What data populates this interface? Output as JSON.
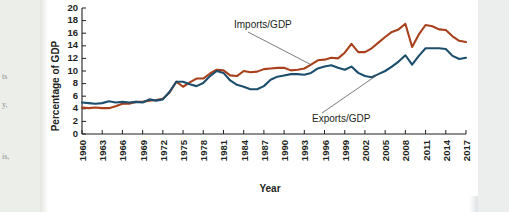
{
  "page": {
    "background_color": "#ffffff",
    "margin_column_color": "#eceeea",
    "right_band_color": "#eceeee",
    "margin_text_fragments": [
      "ts",
      "y,",
      "is,"
    ]
  },
  "chart_data": {
    "type": "line",
    "title": "",
    "xlabel": "Year",
    "ylabel": "Percentage of GDP",
    "ylim": [
      0,
      20
    ],
    "ytick_step": 2,
    "yticks": [
      0,
      2,
      4,
      6,
      8,
      10,
      12,
      14,
      16,
      18,
      20
    ],
    "xlim": [
      1960,
      2017
    ],
    "xticks": [
      1960,
      1963,
      1966,
      1969,
      1972,
      1975,
      1978,
      1981,
      1984,
      1987,
      1990,
      1993,
      1996,
      1999,
      2002,
      2005,
      2008,
      2011,
      2014,
      2017
    ],
    "xtick_labels": [
      "1960",
      "1963",
      "1966",
      "1969",
      "1972",
      "1975",
      "1978",
      "1981",
      "1984",
      "1987",
      "1990",
      "1993",
      "1996",
      "1999",
      "2002",
      "2005",
      "2008",
      "2011",
      "2014",
      "2017"
    ],
    "grid": false,
    "legend_position": "annotation",
    "x": [
      1960,
      1961,
      1962,
      1963,
      1964,
      1965,
      1966,
      1967,
      1968,
      1969,
      1970,
      1971,
      1972,
      1973,
      1974,
      1975,
      1976,
      1977,
      1978,
      1979,
      1980,
      1981,
      1982,
      1983,
      1984,
      1985,
      1986,
      1987,
      1988,
      1989,
      1990,
      1991,
      1992,
      1993,
      1994,
      1995,
      1996,
      1997,
      1998,
      1999,
      2000,
      2001,
      2002,
      2003,
      2004,
      2005,
      2006,
      2007,
      2008,
      2009,
      2010,
      2011,
      2012,
      2013,
      2014,
      2015,
      2016,
      2017
    ],
    "series": [
      {
        "name": "Imports/GDP",
        "color": "#A8401C",
        "values": [
          4.2,
          4.1,
          4.2,
          4.1,
          4.1,
          4.4,
          4.8,
          4.8,
          5.1,
          5.1,
          5.3,
          5.4,
          5.6,
          6.6,
          8.3,
          7.5,
          8.2,
          8.8,
          8.8,
          9.6,
          10.2,
          10.1,
          9.3,
          9.2,
          10.0,
          9.8,
          9.9,
          10.3,
          10.4,
          10.5,
          10.5,
          10.1,
          10.2,
          10.4,
          11.0,
          11.7,
          11.8,
          12.1,
          12.0,
          12.9,
          14.3,
          13.0,
          13.0,
          13.6,
          14.5,
          15.4,
          16.2,
          16.6,
          17.5,
          13.8,
          15.8,
          17.3,
          17.1,
          16.6,
          16.5,
          15.5,
          14.8,
          14.6
        ]
      },
      {
        "name": "Exports/GDP",
        "color": "#1C4E6E",
        "values": [
          5.0,
          4.9,
          4.8,
          4.9,
          5.2,
          5.0,
          5.1,
          5.0,
          5.1,
          5.0,
          5.5,
          5.3,
          5.5,
          6.7,
          8.3,
          8.3,
          7.9,
          7.6,
          8.1,
          9.2,
          10.0,
          9.7,
          8.5,
          7.8,
          7.5,
          7.1,
          7.1,
          7.6,
          8.6,
          9.1,
          9.3,
          9.5,
          9.5,
          9.4,
          9.7,
          10.4,
          10.7,
          10.9,
          10.5,
          10.2,
          10.7,
          9.7,
          9.2,
          9.0,
          9.5,
          10.0,
          10.7,
          11.5,
          12.5,
          11.0,
          12.4,
          13.6,
          13.6,
          13.6,
          13.5,
          12.4,
          11.9,
          12.1
        ]
      }
    ],
    "annotations": [
      {
        "text": "Imports/GDP",
        "series": "Imports/GDP"
      },
      {
        "text": "Exports/GDP",
        "series": "Exports/GDP"
      }
    ]
  }
}
